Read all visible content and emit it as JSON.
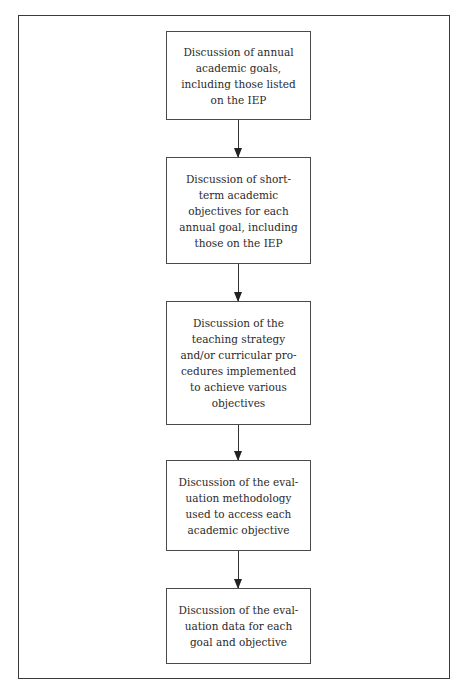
{
  "diagram": {
    "type": "flowchart",
    "direction": "top-to-bottom",
    "steps": [
      {
        "id": 1,
        "label": "Discussion of annual\nacademic goals,\nincluding those listed\non the IEP"
      },
      {
        "id": 2,
        "label": "Discussion of short-\nterm academic\nobjectives for each\nannual goal, including\nthose on the IEP"
      },
      {
        "id": 3,
        "label": "Discussion of the\nteaching strategy\nand/or curricular pro-\ncedures implemented\nto achieve various\nobjectives"
      },
      {
        "id": 4,
        "label": "Discussion of the eval-\nuation methodology\nused to access each\nacademic objective"
      },
      {
        "id": 5,
        "label": "Discussion of the eval-\nuation data for each\ngoal and objective"
      }
    ],
    "edges": [
      {
        "from": 1,
        "to": 2
      },
      {
        "from": 2,
        "to": 3
      },
      {
        "from": 3,
        "to": 4
      },
      {
        "from": 4,
        "to": 5
      }
    ]
  }
}
